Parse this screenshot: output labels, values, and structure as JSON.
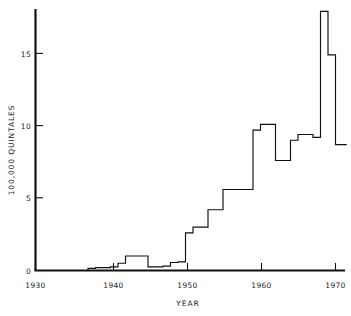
{
  "chart_data": {
    "type": "line",
    "step": "post",
    "title": "",
    "xlabel": "YEAR",
    "ylabel": "100,000 QUINTALES",
    "xlim": [
      1930,
      1971.5
    ],
    "ylim": [
      0,
      18.6
    ],
    "grid": false,
    "legend": null,
    "xticks": [
      1930,
      1940,
      1950,
      1960,
      1970
    ],
    "xtick_labels": [
      "1930",
      "1940",
      "1950",
      "1960",
      "1970"
    ],
    "yticks": [
      0,
      5,
      10,
      15
    ],
    "ytick_labels": [
      "0",
      "5",
      "10",
      "15"
    ],
    "x": [
      1930,
      1931,
      1932,
      1933,
      1934,
      1935,
      1936,
      1937,
      1938,
      1939,
      1940,
      1941,
      1942,
      1943,
      1944,
      1945,
      1946,
      1947,
      1948,
      1949,
      1950,
      1951,
      1952,
      1953,
      1954,
      1955,
      1956,
      1957,
      1958,
      1959,
      1960,
      1961,
      1962,
      1963,
      1964,
      1965,
      1966,
      1967,
      1968,
      1969,
      1970,
      1971
    ],
    "values": [
      0.0,
      0.0,
      0.0,
      0.0,
      0.0,
      0.0,
      0.0,
      0.15,
      0.2,
      0.2,
      0.25,
      0.5,
      1.0,
      1.0,
      1.0,
      0.25,
      0.25,
      0.3,
      0.55,
      0.6,
      2.6,
      3.0,
      3.0,
      4.2,
      4.2,
      5.6,
      5.6,
      5.6,
      5.6,
      9.7,
      10.1,
      10.1,
      7.6,
      7.6,
      9.0,
      9.4,
      9.4,
      9.2,
      17.9,
      14.9,
      8.7,
      8.7
    ],
    "series": [
      {
        "name": "quintales",
        "unit": "100,000 quintales",
        "points": [
          {
            "year": 1930,
            "value": 0.0
          },
          {
            "year": 1937,
            "value": 0.15
          },
          {
            "year": 1938,
            "value": 0.2
          },
          {
            "year": 1940,
            "value": 0.25
          },
          {
            "year": 1941,
            "value": 0.5
          },
          {
            "year": 1942,
            "value": 1.0
          },
          {
            "year": 1945,
            "value": 0.25
          },
          {
            "year": 1947,
            "value": 0.3
          },
          {
            "year": 1948,
            "value": 0.55
          },
          {
            "year": 1949,
            "value": 0.6
          },
          {
            "year": 1950,
            "value": 2.6
          },
          {
            "year": 1951,
            "value": 3.0
          },
          {
            "year": 1953,
            "value": 4.2
          },
          {
            "year": 1955,
            "value": 5.6
          },
          {
            "year": 1959,
            "value": 9.7
          },
          {
            "year": 1960,
            "value": 10.1
          },
          {
            "year": 1962,
            "value": 7.6
          },
          {
            "year": 1964,
            "value": 9.0
          },
          {
            "year": 1965,
            "value": 9.4
          },
          {
            "year": 1967,
            "value": 9.2
          },
          {
            "year": 1968,
            "value": 17.9
          },
          {
            "year": 1969,
            "value": 14.9
          },
          {
            "year": 1970,
            "value": 8.7
          },
          {
            "year": 1971.5,
            "value": 8.7
          }
        ]
      }
    ]
  }
}
